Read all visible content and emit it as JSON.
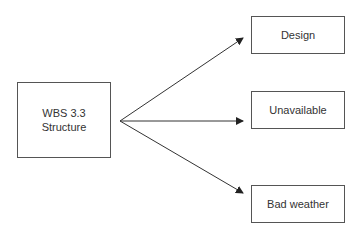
{
  "diagram": {
    "source": {
      "line1": "WBS 3.3",
      "line2": "Structure"
    },
    "targets": [
      {
        "label": "Design"
      },
      {
        "label": "Unavailable"
      },
      {
        "label": "Bad weather"
      }
    ]
  }
}
